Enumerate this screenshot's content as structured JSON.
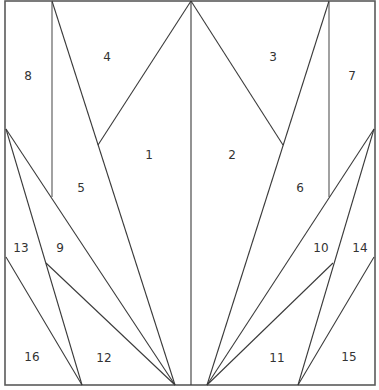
{
  "diagram": {
    "type": "paper-piecing-pattern",
    "stroke_color": "#3a3a3a",
    "background": "#ffffff",
    "pieces": [
      {
        "id": "1",
        "label": "1",
        "x": 149,
        "y": 155
      },
      {
        "id": "2",
        "label": "2",
        "x": 232,
        "y": 155
      },
      {
        "id": "3",
        "label": "3",
        "x": 273,
        "y": 57
      },
      {
        "id": "4",
        "label": "4",
        "x": 107,
        "y": 57
      },
      {
        "id": "5",
        "label": "5",
        "x": 81,
        "y": 188
      },
      {
        "id": "6",
        "label": "6",
        "x": 300,
        "y": 188
      },
      {
        "id": "7",
        "label": "7",
        "x": 352,
        "y": 76
      },
      {
        "id": "8",
        "label": "8",
        "x": 28,
        "y": 76
      },
      {
        "id": "9",
        "label": "9",
        "x": 60,
        "y": 248
      },
      {
        "id": "10",
        "label": "10",
        "x": 321,
        "y": 248
      },
      {
        "id": "11",
        "label": "11",
        "x": 277,
        "y": 358
      },
      {
        "id": "12",
        "label": "12",
        "x": 104,
        "y": 358
      },
      {
        "id": "13",
        "label": "13",
        "x": 21,
        "y": 248
      },
      {
        "id": "14",
        "label": "14",
        "x": 360,
        "y": 248
      },
      {
        "id": "15",
        "label": "15",
        "x": 349,
        "y": 357
      },
      {
        "id": "16",
        "label": "16",
        "x": 32,
        "y": 357
      }
    ]
  }
}
